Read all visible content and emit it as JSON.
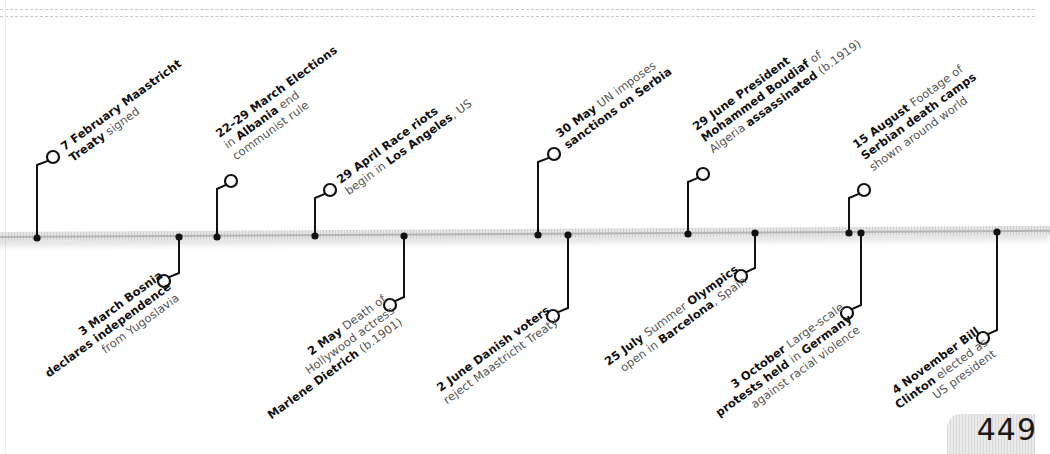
{
  "page": {
    "number": "449"
  },
  "style": {
    "line_color": "#111111",
    "bar_color": "#d9d9d9",
    "text_bold": "#111111",
    "text_light": "#555555"
  },
  "timeline": {
    "year": "1992",
    "events": [
      {
        "id": "feb7",
        "side": "top",
        "dot": [
          37,
          238
        ],
        "circle": [
          53,
          157
        ],
        "lines": [
          [
            {
              "t": "7 February ",
              "b": true
            },
            {
              "t": "Maastricht",
              "b": true
            }
          ],
          [
            {
              "t": "Treaty",
              "b": true
            },
            {
              "t": " signed",
              "b": false
            }
          ]
        ],
        "pos": [
          58,
          150
        ]
      },
      {
        "id": "mar3",
        "side": "bottom",
        "dot": [
          179,
          237
        ],
        "circle": [
          164,
          281
        ],
        "lines": [
          [
            {
              "t": "3 March ",
              "b": true
            },
            {
              "t": "Bosnia",
              "b": true
            }
          ],
          [
            {
              "t": "declares independence",
              "b": true
            }
          ],
          [
            {
              "t": "from Yugoslavia",
              "b": false
            }
          ]
        ],
        "pos": [
          157,
          272
        ]
      },
      {
        "id": "mar22",
        "side": "top",
        "dot": [
          217,
          237
        ],
        "circle": [
          231,
          181
        ],
        "lines": [
          [
            {
              "t": "22–29 March ",
              "b": true
            },
            {
              "t": "Elections",
              "b": true
            }
          ],
          [
            {
              "t": "in ",
              "b": false
            },
            {
              "t": "Albania",
              "b": true
            },
            {
              "t": " end",
              "b": false
            }
          ],
          [
            {
              "t": "communist rule",
              "b": false
            }
          ]
        ],
        "pos": [
          213,
          137
        ]
      },
      {
        "id": "apr29",
        "side": "top",
        "dot": [
          315,
          236
        ],
        "circle": [
          330,
          190
        ],
        "lines": [
          [
            {
              "t": "29 April ",
              "b": true
            },
            {
              "t": "Race riots",
              "b": true
            }
          ],
          [
            {
              "t": "begin in ",
              "b": false
            },
            {
              "t": "Los Angeles",
              "b": true
            },
            {
              "t": ", US",
              "b": false
            }
          ]
        ],
        "pos": [
          334,
          183
        ]
      },
      {
        "id": "may2",
        "side": "bottom",
        "dot": [
          404,
          236
        ],
        "circle": [
          390,
          305
        ],
        "lines": [
          [
            {
              "t": "2 May ",
              "b": true
            },
            {
              "t": "Death of",
              "b": false
            }
          ],
          [
            {
              "t": "Hollywood actress",
              "b": false
            }
          ],
          [
            {
              "t": "Marlene Dietrich",
              "b": true
            },
            {
              "t": " (b.1901)",
              "b": false
            }
          ]
        ],
        "pos": [
          380,
          296
        ]
      },
      {
        "id": "may30",
        "side": "top",
        "dot": [
          538,
          235
        ],
        "circle": [
          554,
          154
        ],
        "lines": [
          [
            {
              "t": "30 May ",
              "b": true
            },
            {
              "t": "UN imposes",
              "b": false
            }
          ],
          [
            {
              "t": "sanctions on Serbia",
              "b": true
            }
          ]
        ],
        "pos": [
          553,
          137
        ]
      },
      {
        "id": "jun2",
        "side": "bottom",
        "dot": [
          568,
          235
        ],
        "circle": [
          553,
          316
        ],
        "lines": [
          [
            {
              "t": "2 June ",
              "b": true
            },
            {
              "t": "Danish voters",
              "b": true
            }
          ],
          [
            {
              "t": "reject Maastricht Treaty",
              "b": false
            }
          ]
        ],
        "pos": [
          544,
          307
        ]
      },
      {
        "id": "jun29",
        "side": "top",
        "dot": [
          688,
          234
        ],
        "circle": [
          703,
          174
        ],
        "lines": [
          [
            {
              "t": "29 June ",
              "b": true
            },
            {
              "t": "President",
              "b": true
            }
          ],
          [
            {
              "t": "Mohammed Boudiaf",
              "b": true
            },
            {
              "t": " of",
              "b": false
            }
          ],
          [
            {
              "t": "Algeria ",
              "b": false
            },
            {
              "t": "assassinated",
              "b": true
            },
            {
              "t": " (b.1919)",
              "b": false
            }
          ]
        ],
        "pos": [
          690,
          130
        ]
      },
      {
        "id": "jul25",
        "side": "bottom",
        "dot": [
          755,
          233
        ],
        "circle": [
          741,
          276
        ],
        "lines": [
          [
            {
              "t": "25 July ",
              "b": true
            },
            {
              "t": "Summer ",
              "b": false
            },
            {
              "t": "Olympics",
              "b": true
            }
          ],
          [
            {
              "t": "open in ",
              "b": false
            },
            {
              "t": "Barcelona",
              "b": true
            },
            {
              "t": ", Spain",
              "b": false
            }
          ]
        ],
        "pos": [
          733,
          266
        ]
      },
      {
        "id": "aug15",
        "side": "top",
        "dot": [
          849,
          233
        ],
        "circle": [
          864,
          190
        ],
        "lines": [
          [
            {
              "t": "15 August ",
              "b": true
            },
            {
              "t": "Footage of",
              "b": false
            }
          ],
          [
            {
              "t": "Serbian death camps",
              "b": true
            }
          ],
          [
            {
              "t": "shown around world",
              "b": false
            }
          ]
        ],
        "pos": [
          850,
          148
        ]
      },
      {
        "id": "oct3",
        "side": "bottom",
        "dot": [
          861,
          233
        ],
        "circle": [
          847,
          313
        ],
        "lines": [
          [
            {
              "t": "3 October ",
              "b": true
            },
            {
              "t": "Large-scale",
              "b": false
            }
          ],
          [
            {
              "t": "protests held",
              "b": true
            },
            {
              "t": " in ",
              "b": false
            },
            {
              "t": "Germany",
              "b": true
            }
          ],
          [
            {
              "t": "against racial violence",
              "b": false
            }
          ]
        ],
        "pos": [
          838,
          304
        ]
      },
      {
        "id": "nov4",
        "side": "bottom",
        "dot": [
          997,
          232
        ],
        "circle": [
          983,
          338
        ],
        "lines": [
          [
            {
              "t": "4 November ",
              "b": true
            },
            {
              "t": "Bill",
              "b": true
            }
          ],
          [
            {
              "t": "Clinton",
              "b": true
            },
            {
              "t": " elected as",
              "b": false
            }
          ],
          [
            {
              "t": "US president",
              "b": false
            }
          ]
        ],
        "pos": [
          974,
          328
        ]
      }
    ]
  }
}
